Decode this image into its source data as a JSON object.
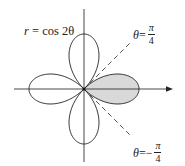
{
  "figure": {
    "type": "polar_curve",
    "curve_label": {
      "lhs": "r",
      "eq": " = ",
      "rhs": "cos 2θ"
    },
    "line_pos": {
      "lhs": "θ",
      "eq": " = ",
      "sign": "",
      "num": "π",
      "den": "4"
    },
    "line_neg": {
      "lhs": "θ",
      "eq": " = ",
      "sign": "−",
      "num": "π",
      "den": "4"
    },
    "shaded_region": "right petal, −π/4 ≤ θ ≤ π/4",
    "colors": {
      "stroke": "#222222",
      "shade": "#d9d9d9",
      "axis": "#333333",
      "dash": "#444444"
    },
    "geometry": {
      "origin_x": 84,
      "origin_y": 89,
      "scale": 55
    }
  }
}
